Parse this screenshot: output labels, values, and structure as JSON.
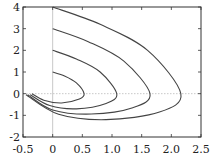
{
  "chart_data": {
    "type": "line",
    "title": "",
    "xlabel": "",
    "ylabel": "",
    "xlim": [
      -0.5,
      2.5
    ],
    "ylim": [
      -2,
      4
    ],
    "xticks": [
      -0.5,
      0,
      0.5,
      1.0,
      1.5,
      2.0,
      2.5
    ],
    "xtick_labels": [
      "-0.5",
      "0",
      "0.5",
      "1.0",
      "1.5",
      "2.0",
      "2.5"
    ],
    "yticks": [
      -2,
      -1,
      0,
      1,
      2,
      3,
      4
    ],
    "ytick_labels": [
      "-2",
      "-1",
      "0",
      "1",
      "2",
      "3",
      "4"
    ],
    "grid": false,
    "reference_lines": {
      "x0": "vertical line at x=0",
      "y0": "dotted horizontal line at y=0"
    },
    "legend": null,
    "series": [
      {
        "name": "curve-1",
        "start": [
          0,
          1
        ],
        "points": [
          [
            0,
            1
          ],
          [
            0.2,
            0.82
          ],
          [
            0.4,
            0.5
          ],
          [
            0.53,
            0
          ],
          [
            0.45,
            -0.25
          ],
          [
            0.15,
            -0.43
          ],
          [
            -0.15,
            -0.3
          ],
          [
            -0.35,
            0
          ]
        ]
      },
      {
        "name": "curve-2",
        "start": [
          0,
          2
        ],
        "points": [
          [
            0,
            2
          ],
          [
            0.4,
            1.6
          ],
          [
            0.8,
            1.0
          ],
          [
            1.08,
            0
          ],
          [
            0.9,
            -0.45
          ],
          [
            0.4,
            -0.7
          ],
          [
            -0.05,
            -0.55
          ],
          [
            -0.38,
            -0.05
          ]
        ]
      },
      {
        "name": "curve-3",
        "start": [
          0,
          3
        ],
        "points": [
          [
            0,
            3
          ],
          [
            0.6,
            2.4
          ],
          [
            1.2,
            1.5
          ],
          [
            1.64,
            0
          ],
          [
            1.35,
            -0.65
          ],
          [
            0.65,
            -0.94
          ],
          [
            0.0,
            -0.75
          ],
          [
            -0.42,
            -0.05
          ]
        ]
      },
      {
        "name": "curve-4",
        "start": [
          0,
          4
        ],
        "points": [
          [
            0,
            4
          ],
          [
            0.8,
            3.2
          ],
          [
            1.6,
            2.0
          ],
          [
            2.16,
            0
          ],
          [
            1.8,
            -0.85
          ],
          [
            0.9,
            -1.2
          ],
          [
            0.1,
            -0.95
          ],
          [
            -0.45,
            -0.05
          ]
        ]
      }
    ]
  },
  "colors": {
    "axis": "#333333",
    "curve": "#444444",
    "refline": "#bbbbbb"
  }
}
